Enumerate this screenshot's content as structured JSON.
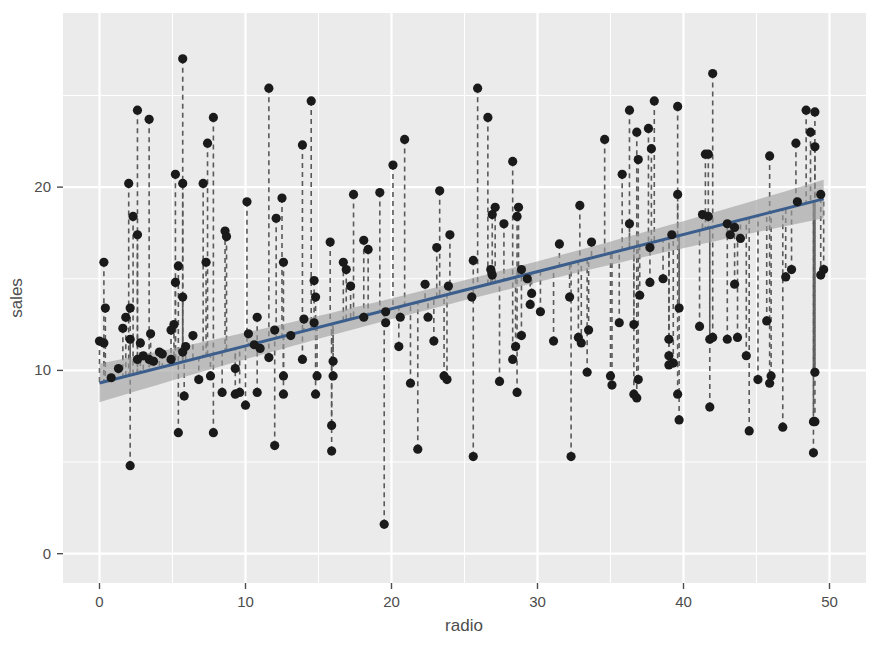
{
  "chart_data": {
    "type": "scatter",
    "title": "",
    "xlabel": "radio",
    "ylabel": "sales",
    "xlim": [
      -2.5,
      52.5
    ],
    "ylim": [
      -1.6,
      29.5
    ],
    "xticks": [
      0,
      10,
      20,
      30,
      40,
      50
    ],
    "yticks": [
      0,
      10,
      20
    ],
    "grid": true,
    "legend": null,
    "panel_background": "#EBEBEB",
    "grid_color": "#FFFFFF",
    "point_color": "#1A1A1A",
    "line_color": "#3B5E8C",
    "band_color": "#A0A0A0",
    "residual_color": "#595959",
    "fit": {
      "label": "linear regression (lm)",
      "intercept": 9.31,
      "slope": 0.2025,
      "x_start": 0.0,
      "x_end": 49.6,
      "y_start": 9.31,
      "y_end": 19.36,
      "ci_half_width_center": 0.55,
      "ci_half_width_edge": 1.05
    },
    "series": [
      {
        "name": "observations",
        "marker": "filled-circle",
        "points": [
          [
            37.8,
            22.1
          ],
          [
            39.3,
            10.4
          ],
          [
            45.9,
            9.3
          ],
          [
            41.3,
            18.5
          ],
          [
            10.8,
            12.9
          ],
          [
            48.9,
            7.2
          ],
          [
            32.8,
            11.8
          ],
          [
            19.6,
            13.2
          ],
          [
            2.1,
            4.8
          ],
          [
            2.6,
            10.6
          ],
          [
            5.8,
            8.6
          ],
          [
            24.0,
            17.4
          ],
          [
            35.1,
            9.2
          ],
          [
            7.6,
            9.7
          ],
          [
            32.9,
            19.0
          ],
          [
            47.7,
            22.4
          ],
          [
            36.6,
            12.5
          ],
          [
            39.6,
            24.4
          ],
          [
            20.5,
            11.3
          ],
          [
            23.9,
            14.6
          ],
          [
            27.7,
            18.0
          ],
          [
            5.1,
            12.5
          ],
          [
            15.9,
            5.6
          ],
          [
            16.9,
            15.5
          ],
          [
            12.6,
            9.7
          ],
          [
            3.5,
            12.0
          ],
          [
            29.3,
            15.0
          ],
          [
            16.7,
            15.9
          ],
          [
            27.1,
            18.9
          ],
          [
            16.0,
            10.5
          ],
          [
            28.3,
            21.4
          ],
          [
            28.9,
            11.9
          ],
          [
            0.8,
            9.6
          ],
          [
            2.6,
            17.4
          ],
          [
            23.8,
            9.5
          ],
          [
            14.0,
            12.8
          ],
          [
            11.6,
            25.4
          ],
          [
            43.5,
            14.7
          ],
          [
            1.3,
            10.1
          ],
          [
            36.9,
            21.5
          ],
          [
            18.4,
            16.6
          ],
          [
            18.1,
            17.1
          ],
          [
            35.8,
            20.7
          ],
          [
            18.1,
            12.9
          ],
          [
            36.8,
            8.5
          ],
          [
            14.7,
            14.9
          ],
          [
            3.4,
            10.6
          ],
          [
            37.6,
            23.2
          ],
          [
            5.2,
            14.8
          ],
          [
            23.6,
            9.7
          ],
          [
            10.6,
            11.4
          ],
          [
            11.6,
            10.7
          ],
          [
            20.9,
            22.6
          ],
          [
            20.1,
            21.2
          ],
          [
            7.1,
            20.2
          ],
          [
            3.4,
            23.7
          ],
          [
            48.9,
            5.5
          ],
          [
            30.2,
            13.2
          ],
          [
            7.8,
            23.8
          ],
          [
            2.3,
            18.4
          ],
          [
            10.0,
            8.1
          ],
          [
            2.6,
            24.2
          ],
          [
            5.4,
            15.7
          ],
          [
            5.7,
            14.0
          ],
          [
            43.0,
            18.0
          ],
          [
            21.3,
            9.3
          ],
          [
            45.1,
            9.5
          ],
          [
            2.1,
            13.4
          ],
          [
            28.7,
            18.9
          ],
          [
            13.9,
            22.3
          ],
          [
            12.1,
            18.3
          ],
          [
            41.1,
            12.4
          ],
          [
            10.8,
            8.8
          ],
          [
            4.1,
            11.0
          ],
          [
            15.8,
            17.0
          ],
          [
            14.8,
            8.7
          ],
          [
            46.8,
            6.9
          ],
          [
            29.6,
            14.2
          ],
          [
            25.6,
            5.3
          ],
          [
            5.7,
            11.0
          ],
          [
            43.7,
            11.8
          ],
          [
            1.6,
            12.3
          ],
          [
            28.5,
            11.3
          ],
          [
            29.5,
            13.6
          ],
          [
            45.9,
            21.7
          ],
          [
            49.4,
            15.2
          ],
          [
            10.2,
            12.0
          ],
          [
            25.6,
            16.0
          ],
          [
            22.5,
            12.9
          ],
          [
            37.7,
            16.7
          ],
          [
            11.0,
            11.2
          ],
          [
            39.7,
            7.3
          ],
          [
            12.5,
            19.4
          ],
          [
            49.0,
            22.2
          ],
          [
            2.8,
            11.5
          ],
          [
            31.5,
            16.9
          ],
          [
            39.0,
            11.7
          ],
          [
            28.9,
            15.5
          ],
          [
            25.9,
            25.4
          ],
          [
            43.9,
            17.2
          ],
          [
            2.1,
            11.7
          ],
          [
            26.6,
            23.8
          ],
          [
            37.7,
            14.8
          ],
          [
            22.3,
            14.7
          ],
          [
            5.2,
            20.7
          ],
          [
            47.8,
            19.2
          ],
          [
            49.0,
            7.2
          ],
          [
            39.6,
            8.7
          ],
          [
            32.3,
            5.3
          ],
          [
            23.3,
            19.8
          ],
          [
            39.7,
            13.4
          ],
          [
            41.5,
            21.8
          ],
          [
            37.0,
            14.1
          ],
          [
            0.3,
            15.9
          ],
          [
            17.2,
            14.6
          ],
          [
            19.6,
            12.6
          ],
          [
            33.5,
            12.2
          ],
          [
            27.4,
            9.4
          ],
          [
            12.6,
            15.9
          ],
          [
            5.4,
            6.6
          ],
          [
            49.6,
            15.5
          ],
          [
            15.9,
            7.0
          ],
          [
            0.0,
            11.6
          ],
          [
            26.9,
            15.2
          ],
          [
            19.2,
            19.7
          ],
          [
            28.3,
            10.6
          ],
          [
            7.8,
            6.6
          ],
          [
            28.6,
            8.8
          ],
          [
            14.5,
            24.7
          ],
          [
            14.9,
            9.7
          ],
          [
            19.5,
            1.6
          ],
          [
            45.7,
            12.7
          ],
          [
            21.8,
            5.7
          ],
          [
            49.4,
            19.6
          ],
          [
            44.3,
            10.8
          ],
          [
            31.1,
            11.6
          ],
          [
            36.9,
            9.5
          ],
          [
            6.4,
            11.9
          ],
          [
            38.0,
            24.7
          ],
          [
            35.0,
            9.7
          ],
          [
            28.6,
            18.4
          ],
          [
            47.0,
            15.1
          ],
          [
            39.2,
            17.4
          ],
          [
            20.6,
            12.9
          ],
          [
            23.1,
            16.7
          ],
          [
            43.0,
            11.7
          ],
          [
            33.0,
            11.5
          ],
          [
            5.7,
            27.0
          ],
          [
            2.0,
            20.2
          ],
          [
            41.8,
            11.7
          ],
          [
            42.0,
            11.8
          ],
          [
            35.6,
            12.6
          ],
          [
            3.7,
            10.5
          ],
          [
            4.9,
            12.2
          ],
          [
            9.3,
            8.7
          ],
          [
            42.0,
            26.2
          ],
          [
            8.6,
            17.6
          ],
          [
            34.6,
            22.6
          ],
          [
            39.0,
            10.3
          ],
          [
            8.7,
            17.3
          ],
          [
            7.3,
            15.9
          ],
          [
            44.5,
            6.7
          ],
          [
            3.0,
            10.8
          ],
          [
            49.0,
            9.9
          ],
          [
            12.0,
            5.9
          ],
          [
            39.6,
            19.6
          ],
          [
            39.0,
            10.8
          ],
          [
            22.9,
            11.6
          ],
          [
            6.8,
            9.5
          ],
          [
            0.3,
            11.5
          ],
          [
            0.4,
            13.4
          ],
          [
            26.9,
            18.5
          ],
          [
            48.7,
            23.0
          ],
          [
            1.8,
            12.9
          ],
          [
            33.4,
            9.9
          ],
          [
            36.3,
            18.0
          ],
          [
            13.1,
            11.9
          ],
          [
            41.8,
            8.0
          ],
          [
            14.7,
            12.6
          ],
          [
            4.3,
            10.9
          ],
          [
            7.4,
            22.4
          ],
          [
            10.1,
            19.2
          ],
          [
            16.0,
            9.7
          ],
          [
            12.6,
            8.7
          ],
          [
            36.3,
            24.2
          ],
          [
            41.7,
            21.8
          ],
          [
            36.6,
            8.7
          ],
          [
            5.7,
            20.2
          ],
          [
            9.6,
            8.8
          ],
          [
            14.8,
            14.0
          ],
          [
            13.9,
            10.6
          ],
          [
            43.2,
            17.4
          ],
          [
            26.8,
            15.5
          ],
          [
            48.4,
            24.2
          ],
          [
            43.5,
            17.8
          ],
          [
            32.2,
            14.0
          ],
          [
            12.0,
            12.2
          ],
          [
            33.7,
            17.0
          ],
          [
            36.8,
            23.0
          ],
          [
            49.0,
            24.1
          ],
          [
            17.4,
            19.6
          ],
          [
            9.3,
            10.1
          ],
          [
            8.4,
            8.8
          ],
          [
            25.5,
            14.0
          ],
          [
            41.7,
            18.4
          ],
          [
            5.9,
            11.3
          ],
          [
            38.6,
            15.0
          ],
          [
            4.9,
            10.6
          ],
          [
            47.4,
            15.5
          ],
          [
            46.0,
            9.7
          ]
        ]
      }
    ]
  }
}
